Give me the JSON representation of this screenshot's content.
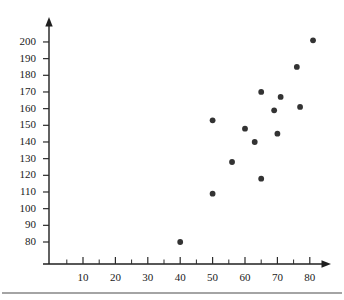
{
  "chart_data": {
    "type": "scatter",
    "title": "",
    "subtitle": "",
    "xlabel": "",
    "ylabel": "",
    "xlim": [
      0,
      85
    ],
    "ylim": [
      75,
      205
    ],
    "grid": false,
    "legend": null,
    "x_ticks": [
      10,
      20,
      30,
      40,
      50,
      60,
      70,
      80
    ],
    "x_tick_labels": [
      "10",
      "20",
      "30",
      "40",
      "50",
      "60",
      "70",
      "80"
    ],
    "x_minor_ticks": [
      5,
      15,
      25,
      35,
      45,
      55,
      65,
      75
    ],
    "y_ticks": [
      80,
      90,
      100,
      110,
      120,
      130,
      140,
      150,
      160,
      170,
      180,
      190,
      200
    ],
    "y_tick_labels": [
      "80",
      "90",
      "100",
      "110",
      "120",
      "130",
      "140",
      "150",
      "160",
      "170",
      "180",
      "190",
      "200"
    ],
    "point_color": "#333333",
    "axis_color": "#1f1f1f",
    "points": [
      {
        "x": 40,
        "y": 80
      },
      {
        "x": 50,
        "y": 109
      },
      {
        "x": 50,
        "y": 153
      },
      {
        "x": 56,
        "y": 128
      },
      {
        "x": 60,
        "y": 148
      },
      {
        "x": 63,
        "y": 140
      },
      {
        "x": 65,
        "y": 118
      },
      {
        "x": 65,
        "y": 170
      },
      {
        "x": 69,
        "y": 159
      },
      {
        "x": 70,
        "y": 145
      },
      {
        "x": 71,
        "y": 167
      },
      {
        "x": 76,
        "y": 185
      },
      {
        "x": 77,
        "y": 161
      },
      {
        "x": 81,
        "y": 201
      }
    ]
  }
}
